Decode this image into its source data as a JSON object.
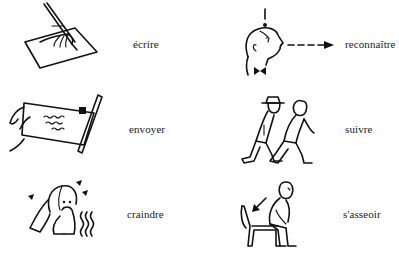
{
  "page": {
    "items": [
      {
        "verb": "écrire",
        "illustration": "hand-writing-pen-icon"
      },
      {
        "verb": "reconnaître",
        "illustration": "head-recognition-icon"
      },
      {
        "verb": "envoyer",
        "illustration": "hand-mailing-letter-icon"
      },
      {
        "verb": "suivre",
        "illustration": "person-following-icon"
      },
      {
        "verb": "craindre",
        "illustration": "frightened-person-icon"
      },
      {
        "verb": "s'asseoir",
        "illustration": "person-sitting-down-icon"
      }
    ]
  }
}
